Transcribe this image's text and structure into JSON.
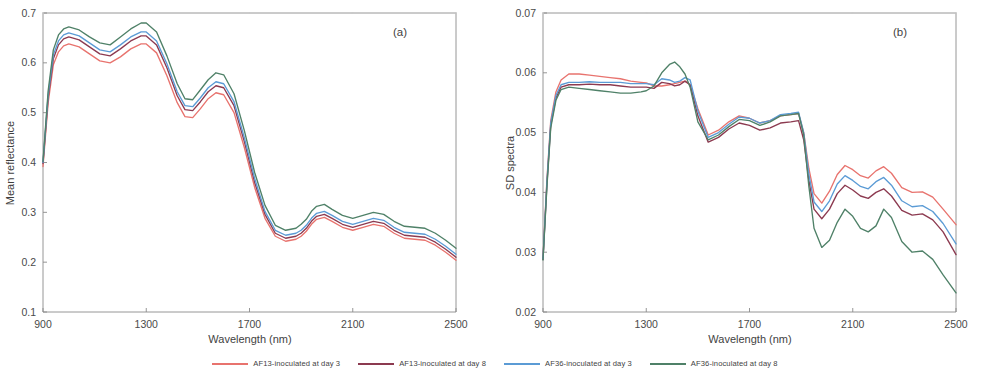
{
  "figure": {
    "panels": [
      {
        "tag": "(a)",
        "xlabel": "Wavelength (nm)",
        "ylabel": "Mean reflectance",
        "xticks": [
          900,
          1300,
          1700,
          2100,
          2500
        ],
        "yticks": [
          "0.7",
          "0.6",
          "0.5",
          "0.4",
          "0.3",
          "0.2",
          "0.1"
        ],
        "xlim": [
          900,
          2500
        ],
        "ylim": [
          0.1,
          0.7
        ]
      },
      {
        "tag": "(b)",
        "xlabel": "Wavelength (nm)",
        "ylabel": "SD spectra",
        "xticks": [
          900,
          1300,
          1700,
          2100,
          2500
        ],
        "yticks": [
          "0.07",
          "0.06",
          "0.05",
          "0.04",
          "0.03",
          "0.02"
        ],
        "xlim": [
          900,
          2500
        ],
        "ylim": [
          0.02,
          0.07
        ]
      }
    ]
  },
  "legend": {
    "position": "bottom-center",
    "entries": [
      {
        "label": "AF13-inoculated at day 3",
        "color": "#e8736e"
      },
      {
        "label": "AF13-inoculated at day 8",
        "color": "#8c3a50"
      },
      {
        "label": "AF36-inoculated at day 3",
        "color": "#5b9bd5"
      },
      {
        "label": "AF36-inoculated at day 8",
        "color": "#4f8168"
      }
    ]
  },
  "chart_data": [
    {
      "type": "line",
      "title": "(a)",
      "xlabel": "Wavelength (nm)",
      "ylabel": "Mean reflectance",
      "xlim": [
        900,
        2500
      ],
      "ylim": [
        0.1,
        0.7
      ],
      "grid": false,
      "legend_position": "bottom-center",
      "x": [
        900,
        920,
        940,
        960,
        980,
        1000,
        1040,
        1080,
        1120,
        1160,
        1200,
        1240,
        1280,
        1300,
        1340,
        1380,
        1420,
        1450,
        1480,
        1510,
        1540,
        1570,
        1600,
        1640,
        1680,
        1720,
        1760,
        1800,
        1840,
        1880,
        1900,
        1920,
        1940,
        1960,
        1990,
        2020,
        2060,
        2100,
        2140,
        2180,
        2220,
        2260,
        2300,
        2340,
        2380,
        2420,
        2460,
        2500
      ],
      "series": [
        {
          "name": "AF13-inoculated at day 3",
          "color": "#e8736e",
          "values": [
            0.392,
            0.52,
            0.596,
            0.622,
            0.634,
            0.638,
            0.632,
            0.618,
            0.604,
            0.6,
            0.612,
            0.628,
            0.638,
            0.638,
            0.62,
            0.574,
            0.52,
            0.492,
            0.49,
            0.508,
            0.528,
            0.54,
            0.536,
            0.5,
            0.43,
            0.35,
            0.288,
            0.252,
            0.242,
            0.246,
            0.252,
            0.262,
            0.276,
            0.286,
            0.29,
            0.282,
            0.27,
            0.264,
            0.27,
            0.276,
            0.272,
            0.258,
            0.248,
            0.246,
            0.244,
            0.234,
            0.22,
            0.204
          ]
        },
        {
          "name": "AF13-inoculated at day 8",
          "color": "#8c3a50",
          "values": [
            0.398,
            0.53,
            0.608,
            0.636,
            0.648,
            0.652,
            0.646,
            0.632,
            0.618,
            0.614,
            0.628,
            0.644,
            0.654,
            0.654,
            0.636,
            0.59,
            0.534,
            0.506,
            0.504,
            0.522,
            0.542,
            0.554,
            0.55,
            0.514,
            0.442,
            0.36,
            0.296,
            0.258,
            0.248,
            0.252,
            0.258,
            0.268,
            0.282,
            0.292,
            0.296,
            0.288,
            0.276,
            0.27,
            0.276,
            0.282,
            0.278,
            0.264,
            0.254,
            0.252,
            0.25,
            0.24,
            0.226,
            0.21
          ]
        },
        {
          "name": "AF36-inoculated at day 3",
          "color": "#5b9bd5",
          "values": [
            0.4,
            0.536,
            0.616,
            0.644,
            0.656,
            0.66,
            0.654,
            0.64,
            0.626,
            0.622,
            0.636,
            0.652,
            0.662,
            0.662,
            0.644,
            0.598,
            0.542,
            0.514,
            0.512,
            0.53,
            0.55,
            0.562,
            0.558,
            0.522,
            0.45,
            0.368,
            0.302,
            0.264,
            0.254,
            0.258,
            0.264,
            0.274,
            0.288,
            0.298,
            0.302,
            0.294,
            0.282,
            0.276,
            0.282,
            0.288,
            0.284,
            0.27,
            0.26,
            0.258,
            0.256,
            0.246,
            0.232,
            0.216
          ]
        },
        {
          "name": "AF36-inoculated at day 8",
          "color": "#4f8168",
          "values": [
            0.402,
            0.544,
            0.626,
            0.656,
            0.668,
            0.672,
            0.666,
            0.652,
            0.64,
            0.636,
            0.652,
            0.668,
            0.68,
            0.68,
            0.662,
            0.614,
            0.558,
            0.528,
            0.526,
            0.546,
            0.566,
            0.58,
            0.576,
            0.538,
            0.464,
            0.38,
            0.314,
            0.274,
            0.264,
            0.268,
            0.276,
            0.286,
            0.302,
            0.312,
            0.316,
            0.306,
            0.294,
            0.288,
            0.294,
            0.3,
            0.296,
            0.282,
            0.272,
            0.27,
            0.268,
            0.258,
            0.244,
            0.228
          ]
        }
      ]
    },
    {
      "type": "line",
      "title": "(b)",
      "xlabel": "Wavelength (nm)",
      "ylabel": "SD spectra",
      "xlim": [
        900,
        2500
      ],
      "ylim": [
        0.02,
        0.07
      ],
      "grid": false,
      "legend_position": "bottom-center",
      "x": [
        900,
        915,
        930,
        950,
        970,
        1000,
        1040,
        1080,
        1120,
        1160,
        1200,
        1240,
        1280,
        1300,
        1330,
        1360,
        1390,
        1410,
        1430,
        1450,
        1470,
        1500,
        1540,
        1580,
        1620,
        1660,
        1700,
        1740,
        1780,
        1820,
        1860,
        1890,
        1910,
        1930,
        1950,
        1980,
        2010,
        2040,
        2070,
        2100,
        2130,
        2160,
        2190,
        2220,
        2250,
        2290,
        2330,
        2370,
        2410,
        2450,
        2500
      ],
      "series": [
        {
          "name": "AF13-inoculated at day 3",
          "color": "#e8736e",
          "values": [
            0.029,
            0.042,
            0.052,
            0.0568,
            0.0588,
            0.0598,
            0.0598,
            0.0596,
            0.0594,
            0.0592,
            0.059,
            0.0586,
            0.0584,
            0.0583,
            0.0578,
            0.0578,
            0.058,
            0.0582,
            0.0584,
            0.0586,
            0.058,
            0.054,
            0.0496,
            0.0504,
            0.0518,
            0.0528,
            0.0524,
            0.0516,
            0.052,
            0.0528,
            0.053,
            0.0532,
            0.05,
            0.044,
            0.0398,
            0.0382,
            0.0402,
            0.043,
            0.0445,
            0.0438,
            0.0428,
            0.0424,
            0.0436,
            0.0443,
            0.0432,
            0.0408,
            0.04,
            0.0401,
            0.0392,
            0.0372,
            0.0346
          ]
        },
        {
          "name": "AF13-inoculated at day 8",
          "color": "#8c3a50",
          "values": [
            0.0288,
            0.0412,
            0.0512,
            0.0558,
            0.0576,
            0.058,
            0.058,
            0.0581,
            0.058,
            0.058,
            0.0578,
            0.0576,
            0.0576,
            0.0576,
            0.0574,
            0.0584,
            0.0582,
            0.0578,
            0.058,
            0.0586,
            0.058,
            0.0528,
            0.0484,
            0.0492,
            0.0506,
            0.0516,
            0.0512,
            0.0504,
            0.0508,
            0.0516,
            0.0518,
            0.052,
            0.0488,
            0.042,
            0.0372,
            0.0356,
            0.0372,
            0.0398,
            0.0412,
            0.0404,
            0.0394,
            0.039,
            0.04,
            0.0406,
            0.0394,
            0.037,
            0.0362,
            0.0364,
            0.0354,
            0.0334,
            0.0296
          ]
        },
        {
          "name": "AF36-inoculated at day 3",
          "color": "#5b9bd5",
          "values": [
            0.0289,
            0.0416,
            0.0516,
            0.0562,
            0.058,
            0.0584,
            0.0584,
            0.0585,
            0.0584,
            0.0584,
            0.0584,
            0.0582,
            0.0582,
            0.0582,
            0.058,
            0.059,
            0.0588,
            0.0584,
            0.0586,
            0.0592,
            0.0588,
            0.0536,
            0.0492,
            0.05,
            0.0514,
            0.0526,
            0.0524,
            0.0516,
            0.052,
            0.053,
            0.0532,
            0.0534,
            0.05,
            0.043,
            0.0384,
            0.0368,
            0.0386,
            0.0414,
            0.0428,
            0.042,
            0.041,
            0.0406,
            0.0418,
            0.0425,
            0.0412,
            0.0386,
            0.0376,
            0.0378,
            0.0368,
            0.0348,
            0.0314
          ]
        },
        {
          "name": "AF36-inoculated at day 8",
          "color": "#4f8168",
          "values": [
            0.0287,
            0.0408,
            0.0508,
            0.0554,
            0.0572,
            0.0576,
            0.0574,
            0.0572,
            0.057,
            0.0568,
            0.0566,
            0.0566,
            0.0568,
            0.057,
            0.0578,
            0.06,
            0.0614,
            0.0618,
            0.061,
            0.0598,
            0.0576,
            0.0518,
            0.0488,
            0.0496,
            0.051,
            0.0522,
            0.052,
            0.0512,
            0.0518,
            0.0528,
            0.053,
            0.0532,
            0.0496,
            0.041,
            0.034,
            0.0308,
            0.032,
            0.035,
            0.0372,
            0.036,
            0.034,
            0.0334,
            0.0344,
            0.0372,
            0.0358,
            0.0318,
            0.03,
            0.0302,
            0.0288,
            0.0262,
            0.0232
          ]
        }
      ]
    }
  ]
}
